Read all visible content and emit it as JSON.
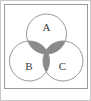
{
  "figure": {
    "name": "venn-diagram-three-sets",
    "caption": "",
    "background_color": "#ffffff"
  },
  "frame": {
    "outer_border_color": "#c9c9c9",
    "inner_box": {
      "name": "diagram-panel",
      "x": 3,
      "y": 3,
      "width": 84,
      "height": 85,
      "stroke_color": "#9a9a9a",
      "fill_color": "#ffffff"
    }
  },
  "chart_data": {
    "type": "venn",
    "title": "",
    "xlabel": "",
    "ylabel": "",
    "sets": [
      {
        "id": "A",
        "label": "A",
        "cx": 45.5,
        "cy": 33.0,
        "r": 20.0,
        "label_x": 45.5,
        "label_y": 27.0
      },
      {
        "id": "B",
        "label": "B",
        "cx": 28.5,
        "cy": 60.0,
        "r": 20.0,
        "label_x": 28.0,
        "label_y": 66.0
      },
      {
        "id": "C",
        "label": "C",
        "cx": 62.0,
        "cy": 60.0,
        "r": 20.0,
        "label_x": 61.5,
        "label_y": 66.0
      }
    ],
    "regions": [
      {
        "id": "A_only",
        "expression": "A \\ (B ∪ C)",
        "shaded": false,
        "fill": "#ffffff"
      },
      {
        "id": "B_only",
        "expression": "B \\ (A ∪ C)",
        "shaded": false,
        "fill": "#ffffff"
      },
      {
        "id": "C_only",
        "expression": "C \\ (A ∪ B)",
        "shaded": false,
        "fill": "#ffffff"
      },
      {
        "id": "AB",
        "expression": "A ∩ B",
        "shaded": true,
        "fill": "#8a8a8a"
      },
      {
        "id": "AC",
        "expression": "A ∩ C",
        "shaded": true,
        "fill": "#8a8a8a"
      },
      {
        "id": "BC",
        "expression": "B ∩ C",
        "shaded": true,
        "fill": "#8a8a8a"
      },
      {
        "id": "ABC",
        "expression": "A ∩ B ∩ C",
        "shaded": true,
        "fill": "#8f8f8f"
      }
    ],
    "shaded_description": "all pairwise intersections",
    "circle_stroke_color": "#8d8d8d",
    "circle_fill_color": "#ffffff",
    "shade_color": "#8a8a8a",
    "label_color": "#3a3a3a",
    "legend": [],
    "annotations": []
  },
  "labels": {
    "a": "A",
    "b": "B",
    "c": "C"
  }
}
